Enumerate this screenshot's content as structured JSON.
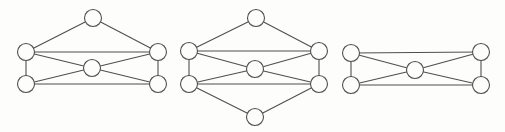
{
  "figure": {
    "width": 505,
    "height": 132,
    "background": "#fdfdfc",
    "stroke_color": "#4f4f4f",
    "stroke_width": 1.1,
    "vertex_fill": "#fdfdfc",
    "vertex_radius": 8.5,
    "graphs": [
      {
        "name": "graph-1",
        "vertex_count": 6,
        "edge_count": 10,
        "vertices": [
          {
            "id": "top",
            "x": 93,
            "y": 18
          },
          {
            "id": "upper-left",
            "x": 26,
            "y": 52
          },
          {
            "id": "upper-right",
            "x": 158,
            "y": 52
          },
          {
            "id": "center",
            "x": 92,
            "y": 68
          },
          {
            "id": "lower-left",
            "x": 26,
            "y": 84
          },
          {
            "id": "lower-right",
            "x": 158,
            "y": 84
          }
        ],
        "edges": [
          [
            "top",
            "upper-left"
          ],
          [
            "top",
            "upper-right"
          ],
          [
            "upper-left",
            "upper-right"
          ],
          [
            "upper-left",
            "lower-left"
          ],
          [
            "upper-right",
            "lower-right"
          ],
          [
            "lower-left",
            "lower-right"
          ],
          [
            "center",
            "upper-left"
          ],
          [
            "center",
            "upper-right"
          ],
          [
            "center",
            "lower-left"
          ],
          [
            "center",
            "lower-right"
          ]
        ]
      },
      {
        "name": "graph-2",
        "vertex_count": 7,
        "edge_count": 12,
        "vertices": [
          {
            "id": "top",
            "x": 256,
            "y": 18
          },
          {
            "id": "upper-left",
            "x": 189,
            "y": 51
          },
          {
            "id": "upper-right",
            "x": 319,
            "y": 51
          },
          {
            "id": "center",
            "x": 255,
            "y": 69
          },
          {
            "id": "lower-left",
            "x": 189,
            "y": 84
          },
          {
            "id": "lower-right",
            "x": 319,
            "y": 84
          },
          {
            "id": "bottom",
            "x": 255,
            "y": 117
          }
        ],
        "edges": [
          [
            "top",
            "upper-left"
          ],
          [
            "top",
            "upper-right"
          ],
          [
            "upper-left",
            "upper-right"
          ],
          [
            "upper-left",
            "lower-left"
          ],
          [
            "upper-right",
            "lower-right"
          ],
          [
            "lower-left",
            "lower-right"
          ],
          [
            "center",
            "upper-left"
          ],
          [
            "center",
            "upper-right"
          ],
          [
            "center",
            "lower-left"
          ],
          [
            "center",
            "lower-right"
          ],
          [
            "bottom",
            "lower-left"
          ],
          [
            "bottom",
            "lower-right"
          ]
        ]
      },
      {
        "name": "graph-3",
        "vertex_count": 5,
        "edge_count": 8,
        "vertices": [
          {
            "id": "upper-left",
            "x": 351,
            "y": 53
          },
          {
            "id": "upper-right",
            "x": 481,
            "y": 52
          },
          {
            "id": "center",
            "x": 415,
            "y": 70
          },
          {
            "id": "lower-left",
            "x": 351,
            "y": 85
          },
          {
            "id": "lower-right",
            "x": 481,
            "y": 85
          }
        ],
        "edges": [
          [
            "upper-left",
            "upper-right"
          ],
          [
            "upper-left",
            "lower-left"
          ],
          [
            "upper-right",
            "lower-right"
          ],
          [
            "lower-left",
            "lower-right"
          ],
          [
            "center",
            "upper-left"
          ],
          [
            "center",
            "upper-right"
          ],
          [
            "center",
            "lower-left"
          ],
          [
            "center",
            "lower-right"
          ]
        ]
      }
    ]
  }
}
